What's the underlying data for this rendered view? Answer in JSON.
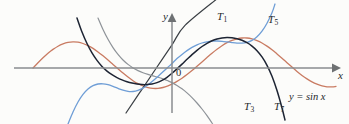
{
  "figure": {
    "background_color": "#fcfcfa",
    "axes": {
      "x_label": "x",
      "y_label": "y",
      "origin_label": "0",
      "origin_px": [
        172,
        68
      ],
      "x_axis_y_px": 68,
      "y_axis_x_px": 172,
      "x_axis_range_px": [
        14,
        336
      ],
      "y_axis_range_px": [
        18,
        113
      ],
      "axis_color": "#8a8d8f",
      "arrows": [
        "x-positive",
        "y-positive"
      ]
    },
    "labels": {
      "t1": "T",
      "t1_sub": "1",
      "t3": "T",
      "t3_sub": "3",
      "t5": "T",
      "t5_sub": "5",
      "t7": "T",
      "t7_sub": "7",
      "equation": "y = sin x"
    }
  },
  "chart_data": {
    "type": "line",
    "title": "",
    "xlabel": "x",
    "ylabel": "y",
    "subtitle": "Taylor polynomials T1, T3, T5, T7 of sin x centered at 0",
    "grid": false,
    "legend_position": "inline-annotations",
    "x_unit_px": 20.2,
    "y_unit_px": 30,
    "origin_px": [
      172,
      68
    ],
    "xlim": [
      -7.82,
      8.12
    ],
    "ylim": [
      -1.67,
      1.67
    ],
    "series": [
      {
        "name": "y = sin x",
        "label": "y = sin x",
        "color": "#c97b62",
        "width": 1.3,
        "formula": "sin(x)",
        "x_domain": [
          -6.9,
          8.12
        ],
        "points_px": [
          [
            33,
            68
          ],
          [
            38,
            62.7
          ],
          [
            43,
            57.7
          ],
          [
            48,
            53.2
          ],
          [
            53,
            49.4
          ],
          [
            58,
            46.2
          ],
          [
            63,
            43.9
          ],
          [
            68,
            42.4
          ],
          [
            73,
            41.9
          ],
          [
            78,
            42.2
          ],
          [
            83,
            43.5
          ],
          [
            88,
            45.6
          ],
          [
            93,
            48.4
          ],
          [
            98,
            51.9
          ],
          [
            103,
            55.8
          ],
          [
            108,
            60
          ],
          [
            113,
            64.4
          ],
          [
            118,
            68.8
          ],
          [
            123,
            73.1
          ],
          [
            128,
            77.1
          ],
          [
            133,
            80.7
          ],
          [
            138,
            83.7
          ],
          [
            143,
            86
          ],
          [
            148,
            87.6
          ],
          [
            153,
            88.4
          ],
          [
            158,
            88.4
          ],
          [
            163,
            87.5
          ],
          [
            168,
            85.8
          ],
          [
            172,
            84
          ],
          [
            177,
            81.4
          ],
          [
            182,
            78.2
          ],
          [
            187,
            74.6
          ],
          [
            192,
            70.6
          ],
          [
            197,
            66.3
          ],
          [
            202,
            61.9
          ],
          [
            207,
            57.5
          ],
          [
            212,
            53.2
          ],
          [
            217,
            49.2
          ],
          [
            222,
            45.7
          ],
          [
            227,
            42.7
          ],
          [
            232,
            40.4
          ],
          [
            237,
            38.8
          ],
          [
            242,
            38
          ],
          [
            247,
            38
          ],
          [
            252,
            38.9
          ],
          [
            257,
            40.6
          ],
          [
            262,
            43
          ],
          [
            267,
            46.1
          ],
          [
            272,
            49.8
          ],
          [
            277,
            53.9
          ],
          [
            282,
            58.2
          ],
          [
            287,
            62.7
          ],
          [
            292,
            67.1
          ],
          [
            297,
            71.4
          ],
          [
            302,
            75.4
          ],
          [
            307,
            78.9
          ],
          [
            312,
            81.9
          ],
          [
            317,
            84.2
          ],
          [
            322,
            85.9
          ],
          [
            327,
            86.8
          ],
          [
            332,
            86.9
          ],
          [
            336,
            86.4
          ]
        ]
      },
      {
        "name": "T1",
        "label": "T",
        "sub": "1",
        "color": "#3a3f44",
        "width": 1.2,
        "formula": "x",
        "x_domain": [
          -2.25,
          2.3
        ],
        "points_px": [
          [
            126,
            113
          ],
          [
            140,
            92.2
          ],
          [
            155,
            70
          ],
          [
            172,
            44.8
          ],
          [
            185,
            25.4
          ],
          [
            218,
            -2
          ]
        ]
      },
      {
        "name": "T3",
        "label": "T",
        "sub": "3",
        "color": "#8e9398",
        "width": 1.2,
        "formula": "x - x^3/6",
        "x_domain": [
          -3.7,
          4.05
        ],
        "points_px": [
          [
            98,
            18
          ],
          [
            103,
            29.5
          ],
          [
            108,
            39.3
          ],
          [
            113,
            47.6
          ],
          [
            118,
            54.4
          ],
          [
            123,
            60
          ],
          [
            128,
            64.4
          ],
          [
            133,
            67.9
          ],
          [
            138,
            70.6
          ],
          [
            143,
            72.7
          ],
          [
            148,
            74.4
          ],
          [
            153,
            75.9
          ],
          [
            158,
            77.3
          ],
          [
            163,
            78.9
          ],
          [
            168,
            80.8
          ],
          [
            172,
            82.6
          ],
          [
            177,
            85.4
          ],
          [
            182,
            88.8
          ],
          [
            187,
            92.9
          ],
          [
            192,
            97.6
          ],
          [
            197,
            103
          ],
          [
            202,
            109
          ],
          [
            207,
            115.6
          ],
          [
            212,
            123
          ],
          [
            215,
            128
          ]
        ]
      },
      {
        "name": "T5",
        "label": "T",
        "sub": "5",
        "color": "#6f9ed6",
        "width": 1.3,
        "formula": "x - x^3/6 + x^5/120",
        "x_domain": [
          -5.2,
          5.4
        ],
        "points_px": [
          [
            68,
            124
          ],
          [
            73,
            112
          ],
          [
            78,
            102
          ],
          [
            83,
            94.4
          ],
          [
            88,
            89
          ],
          [
            93,
            85.6
          ],
          [
            98,
            84
          ],
          [
            103,
            83.8
          ],
          [
            108,
            84.7
          ],
          [
            113,
            86.4
          ],
          [
            118,
            88.4
          ],
          [
            123,
            90.2
          ],
          [
            128,
            91.4
          ],
          [
            133,
            91.5
          ],
          [
            138,
            90.4
          ],
          [
            143,
            88.1
          ],
          [
            148,
            84.8
          ],
          [
            153,
            80.8
          ],
          [
            158,
            76.4
          ],
          [
            163,
            71.8
          ],
          [
            168,
            67.2
          ],
          [
            172,
            63.5
          ],
          [
            177,
            58.6
          ],
          [
            182,
            54.4
          ],
          [
            187,
            50.6
          ],
          [
            192,
            47.4
          ],
          [
            197,
            44.9
          ],
          [
            202,
            43
          ],
          [
            207,
            41.8
          ],
          [
            212,
            41.1
          ],
          [
            217,
            41
          ],
          [
            222,
            41.3
          ],
          [
            227,
            41.9
          ],
          [
            232,
            42.6
          ],
          [
            237,
            43.1
          ],
          [
            242,
            43.1
          ],
          [
            247,
            42.4
          ],
          [
            252,
            40.4
          ],
          [
            257,
            36.8
          ],
          [
            262,
            31.2
          ],
          [
            267,
            23.3
          ],
          [
            272,
            12.8
          ],
          [
            275,
            4
          ]
        ]
      },
      {
        "name": "T7",
        "label": "T",
        "sub": "7",
        "color": "#1d2433",
        "width": 1.5,
        "formula": "x - x^3/6 + x^5/120 - x^7/5040",
        "x_domain": [
          -5.05,
          5.15
        ],
        "points_px": [
          [
            77,
            18
          ],
          [
            82,
            32
          ],
          [
            87,
            43.5
          ],
          [
            92,
            52.9
          ],
          [
            97,
            60.4
          ],
          [
            102,
            66.4
          ],
          [
            107,
            71.1
          ],
          [
            112,
            74.7
          ],
          [
            117,
            77.6
          ],
          [
            122,
            79.9
          ],
          [
            127,
            81.7
          ],
          [
            132,
            83.1
          ],
          [
            137,
            84.1
          ],
          [
            142,
            84.6
          ],
          [
            147,
            84.6
          ],
          [
            152,
            84
          ],
          [
            157,
            82.6
          ],
          [
            162,
            80.4
          ],
          [
            167,
            77.3
          ],
          [
            172,
            73.3
          ],
          [
            177,
            68.8
          ],
          [
            182,
            64.1
          ],
          [
            187,
            59.3
          ],
          [
            192,
            54.6
          ],
          [
            197,
            50.3
          ],
          [
            202,
            46.5
          ],
          [
            207,
            43.3
          ],
          [
            212,
            40.8
          ],
          [
            217,
            39
          ],
          [
            222,
            37.9
          ],
          [
            227,
            37.5
          ],
          [
            232,
            37.8
          ],
          [
            237,
            38.7
          ],
          [
            242,
            40.3
          ],
          [
            247,
            42.7
          ],
          [
            252,
            46.1
          ],
          [
            257,
            50.7
          ],
          [
            262,
            56.9
          ],
          [
            267,
            65.3
          ],
          [
            272,
            76.3
          ],
          [
            277,
            90.6
          ],
          [
            282,
            108
          ],
          [
            285,
            120
          ]
        ]
      }
    ],
    "annotations": [
      {
        "text": "T1",
        "x_px": 217,
        "y_px": 11
      },
      {
        "text": "T5",
        "x_px": 268,
        "y_px": 14
      },
      {
        "text": "T3",
        "x_px": 244,
        "y_px": 101
      },
      {
        "text": "T7",
        "x_px": 274,
        "y_px": 101
      },
      {
        "text": "y = sin x",
        "x_px": 289,
        "y_px": 92
      },
      {
        "text": "0",
        "x_px": 176,
        "y_px": 68
      },
      {
        "text": "y",
        "x_px": 163,
        "y_px": 11
      },
      {
        "text": "x",
        "x_px": 338,
        "y_px": 70
      }
    ]
  }
}
